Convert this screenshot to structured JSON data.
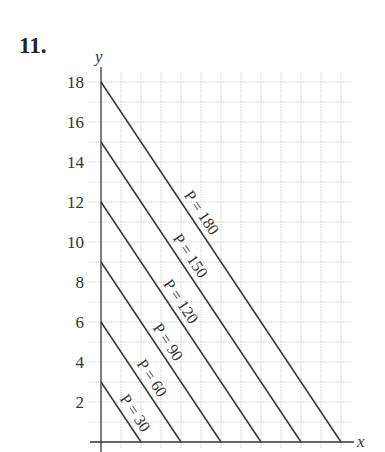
{
  "problem_number": "11.",
  "chart_data": {
    "type": "line",
    "title": "",
    "xlabel": "x",
    "ylabel": "y",
    "xlim": [
      0,
      12.5
    ],
    "ylim": [
      0,
      18.5
    ],
    "grid": true,
    "y_ticks": [
      2,
      4,
      6,
      8,
      10,
      12,
      14,
      16,
      18
    ],
    "x_ticks": [],
    "legend": "none (lines labeled inline)",
    "series": [
      {
        "name": "P = 30",
        "points": [
          [
            0,
            3
          ],
          [
            2,
            0
          ]
        ]
      },
      {
        "name": "P = 60",
        "points": [
          [
            0,
            6
          ],
          [
            4,
            0
          ]
        ]
      },
      {
        "name": "P = 90",
        "points": [
          [
            0,
            9
          ],
          [
            6,
            0
          ]
        ]
      },
      {
        "name": "P = 120",
        "points": [
          [
            0,
            12
          ],
          [
            8,
            0
          ]
        ]
      },
      {
        "name": "P = 150",
        "points": [
          [
            0,
            15
          ],
          [
            10,
            0
          ]
        ]
      },
      {
        "name": "P = 180",
        "points": [
          [
            0,
            18
          ],
          [
            12,
            0
          ]
        ]
      }
    ]
  },
  "layout": {
    "origin_px": [
      101,
      442
    ],
    "px_per_unit": 20,
    "line_color": "#3a3a3a",
    "grid_color": "#c8c8c8"
  }
}
